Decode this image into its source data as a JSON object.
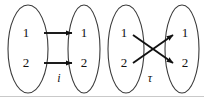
{
  "figure": {
    "background_color": "#ffffff",
    "stroke_color": "#111111",
    "ellipse_stroke_color": "#3b3b3b",
    "rule_color": "#c9c9c9",
    "width": 204,
    "height": 100
  },
  "diagrams": [
    {
      "id": "identity-map",
      "map_label": "i",
      "map_kind": "identity",
      "domain": {
        "elements": [
          {
            "label": "1",
            "x": 26,
            "y": 34
          },
          {
            "label": "2",
            "x": 26,
            "y": 64
          }
        ],
        "ellipse": {
          "cx": 28,
          "cy": 49,
          "rx": 20,
          "ry": 44
        }
      },
      "codomain": {
        "elements": [
          {
            "label": "1",
            "x": 84,
            "y": 34
          },
          {
            "label": "2",
            "x": 84,
            "y": 64
          }
        ],
        "ellipse": {
          "cx": 84,
          "cy": 49,
          "rx": 16,
          "ry": 44
        }
      },
      "arrows": [
        {
          "from": "1",
          "to": "1",
          "x1": 44,
          "y1": 33,
          "x2": 72,
          "y2": 33
        },
        {
          "from": "2",
          "to": "2",
          "x1": 44,
          "y1": 63,
          "x2": 72,
          "y2": 63
        }
      ],
      "map_label_pos": {
        "x": 59,
        "y": 79
      }
    },
    {
      "id": "transposition-map",
      "map_label": "τ",
      "map_kind": "transposition",
      "domain": {
        "elements": [
          {
            "label": "1",
            "x": 124,
            "y": 34
          },
          {
            "label": "2",
            "x": 124,
            "y": 64
          }
        ],
        "ellipse": {
          "cx": 126,
          "cy": 49,
          "rx": 18,
          "ry": 44
        }
      },
      "codomain": {
        "elements": [
          {
            "label": "1",
            "x": 185,
            "y": 34
          },
          {
            "label": "2",
            "x": 185,
            "y": 64
          }
        ],
        "ellipse": {
          "cx": 182,
          "cy": 49,
          "rx": 17,
          "ry": 44
        }
      },
      "arrows": [
        {
          "from": "1",
          "to": "2",
          "x1": 133,
          "y1": 35,
          "x2": 173,
          "y2": 63
        },
        {
          "from": "2",
          "to": "1",
          "x1": 133,
          "y1": 63,
          "x2": 173,
          "y2": 35
        }
      ],
      "map_label_pos": {
        "x": 150,
        "y": 79
      }
    }
  ],
  "baseline_rule": {
    "x1": 0,
    "y1": 96.5,
    "x2": 204,
    "y2": 96.5
  }
}
